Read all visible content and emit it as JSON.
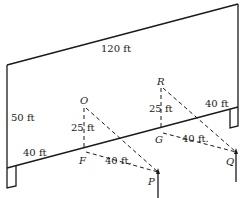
{
  "diagram": {
    "type": "3D geometry - vertical wall with poles and dashed triangles",
    "dimensions": {
      "wall_length": "120 ft",
      "wall_height": "50 ft",
      "left_segment": "40 ft",
      "right_segment": "40 ft",
      "OF": "25 ft",
      "FP": "40 ft.",
      "RG": "25 ft",
      "GQ": "40 ft."
    },
    "points": {
      "O": "O",
      "F": "F",
      "P": "P",
      "R": "R",
      "G": "G",
      "Q": "Q"
    },
    "colors": {
      "line": "#1a1a1a",
      "background": "#ffffff"
    }
  }
}
